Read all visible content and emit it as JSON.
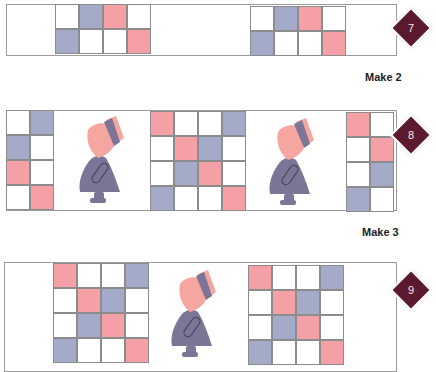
{
  "diagram": {
    "colors": {
      "white": "#ffffff",
      "blue": "#a3abc9",
      "pink": "#f5a0a6",
      "badge": "#5c1a2e",
      "figure_dress": "#7d7596",
      "figure_bonnet": "#f5a6a0",
      "figure_band": "#7d7596"
    },
    "rows": [
      {
        "badge": "7",
        "make_label": "Make 2",
        "blocks": [
          {
            "id": "r7-left",
            "cells": [
              [
                "W",
                "B",
                "P",
                "W"
              ],
              [
                "B",
                "W",
                "W",
                "P"
              ]
            ]
          },
          {
            "id": "r7-right",
            "cells": [
              [
                "W",
                "B",
                "P",
                "W"
              ],
              [
                "B",
                "W",
                "W",
                "P"
              ]
            ]
          }
        ],
        "figures": 0
      },
      {
        "badge": "8",
        "make_label": "Make 3",
        "blocks": [
          {
            "id": "r8-left",
            "cells": [
              [
                "W",
                "B"
              ],
              [
                "B",
                "W"
              ],
              [
                "P",
                "W"
              ],
              [
                "W",
                "P"
              ]
            ]
          },
          {
            "id": "r8-center",
            "cells": [
              [
                "P",
                "W",
                "W",
                "B"
              ],
              [
                "W",
                "P",
                "B",
                "W"
              ],
              [
                "W",
                "B",
                "P",
                "W"
              ],
              [
                "B",
                "W",
                "W",
                "P"
              ]
            ]
          },
          {
            "id": "r8-right",
            "cells": [
              [
                "P",
                "W"
              ],
              [
                "W",
                "P"
              ],
              [
                "W",
                "B"
              ],
              [
                "B",
                "W"
              ]
            ]
          }
        ],
        "figures": 2
      },
      {
        "badge": "9",
        "make_label": "",
        "blocks": [
          {
            "id": "r9-left",
            "cells": [
              [
                "P",
                "W",
                "W",
                "B"
              ],
              [
                "W",
                "P",
                "B",
                "W"
              ],
              [
                "W",
                "B",
                "P",
                "W"
              ],
              [
                "B",
                "W",
                "W",
                "P"
              ]
            ]
          },
          {
            "id": "r9-right",
            "cells": [
              [
                "P",
                "W",
                "W",
                "B"
              ],
              [
                "W",
                "P",
                "B",
                "W"
              ],
              [
                "W",
                "B",
                "P",
                "W"
              ],
              [
                "B",
                "W",
                "W",
                "P"
              ]
            ]
          }
        ],
        "figures": 1
      }
    ]
  }
}
